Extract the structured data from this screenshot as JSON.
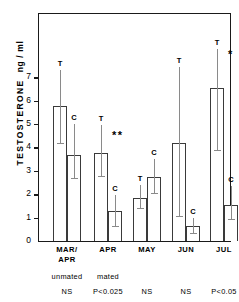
{
  "chart_data": {
    "type": "bar",
    "title": "",
    "xlabel": "",
    "ylabel": "TESTOSTERONE",
    "yunits": "ng / ml",
    "ylim": [
      0,
      7.9
    ],
    "yticks": [
      0,
      1,
      2,
      3,
      4,
      5,
      6,
      7
    ],
    "ytick_labels": [
      "0",
      "1",
      "2",
      "3",
      "4",
      "5",
      "6",
      "7"
    ],
    "grid": false,
    "legend": "none",
    "categories": [
      "MAR/\nAPR",
      "APR",
      "MAY",
      "JUN",
      "JUL"
    ],
    "series": [
      {
        "name": "T",
        "label": "T",
        "values": [
          5.75,
          3.78,
          1.85,
          4.2,
          6.55
        ],
        "err_low": [
          4.2,
          2.78,
          1.4,
          1.05,
          3.9
        ],
        "err_high": [
          7.3,
          4.95,
          2.4,
          7.45,
          8.2
        ]
      },
      {
        "name": "C",
        "label": "C",
        "values": [
          3.68,
          1.28,
          2.75,
          0.65,
          1.55
        ],
        "err_low": [
          2.7,
          0.65,
          2.05,
          0.35,
          0.95
        ],
        "err_high": [
          5.0,
          1.95,
          3.5,
          1.0,
          2.35
        ]
      }
    ],
    "significance_marks": [
      "",
      "**",
      "",
      "",
      "*"
    ],
    "mating_status": [
      "unmated",
      "mated"
    ],
    "stats": [
      "NS",
      "P<0.025",
      "NS",
      "NS",
      "P<0.05"
    ]
  },
  "axis": {
    "y_title_main": "TESTOSTERONE",
    "y_title_units": "ng / ml"
  }
}
